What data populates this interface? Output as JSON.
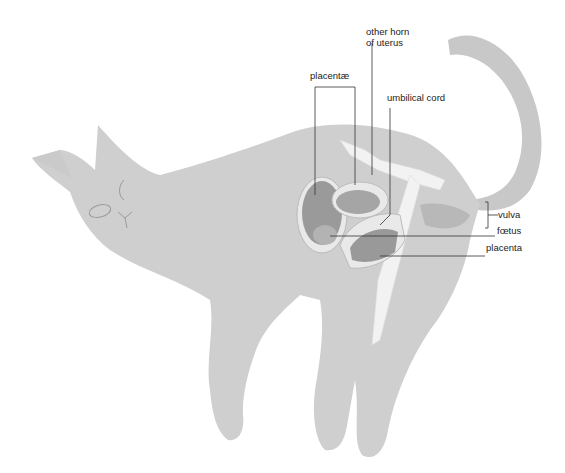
{
  "diagram": {
    "colors": {
      "body": "#cfcfcf",
      "body_shade": "#c2c2c2",
      "tail": "#c8c8c8",
      "uterus_wall": "#e9e9e9",
      "placenta": "#9a9a9a",
      "foetus": "#b3b3b3",
      "bone": "#f2f2f2",
      "leader_line": "#333333",
      "label_text": "#222222"
    },
    "labels": {
      "other_horn_line1": "other horn",
      "other_horn_line2": "of uterus",
      "placentae": "placentæ",
      "umbilical_cord": "umbilical cord",
      "vulva": "vulva",
      "foetus": "fœtus",
      "placenta": "placenta"
    }
  }
}
